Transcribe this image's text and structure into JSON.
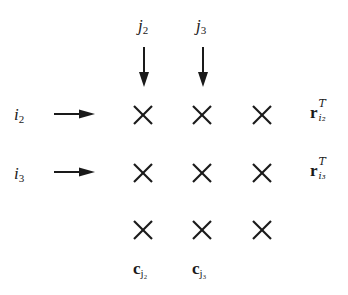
{
  "diagram": {
    "column_labels": [
      {
        "base": "j",
        "sub": "2",
        "x": 138,
        "y": 17
      },
      {
        "base": "j",
        "sub": "3",
        "x": 196,
        "y": 17
      }
    ],
    "row_labels": [
      {
        "base": "i",
        "sub": "2",
        "x": 14,
        "y": 106
      },
      {
        "base": "i",
        "sub": "3",
        "x": 14,
        "y": 165
      }
    ],
    "row_vectors": [
      {
        "base": "r",
        "sup": "T",
        "sub": "i₂",
        "x": 310,
        "y": 104
      },
      {
        "base": "r",
        "sup": "T",
        "sub": "i₃",
        "x": 310,
        "y": 162
      }
    ],
    "column_vectors": [
      {
        "base": "c",
        "sub": "j₂",
        "x": 133,
        "y": 260
      },
      {
        "base": "c",
        "sub": "j₃",
        "x": 192,
        "y": 260
      }
    ],
    "grid": {
      "rows": 3,
      "cols": 3,
      "col_centers": [
        143,
        202,
        262
      ],
      "row_centers": [
        115,
        173,
        230
      ],
      "marker": "cross"
    },
    "colors": {
      "stroke": "#1a1a1a",
      "background": "#ffffff"
    }
  }
}
